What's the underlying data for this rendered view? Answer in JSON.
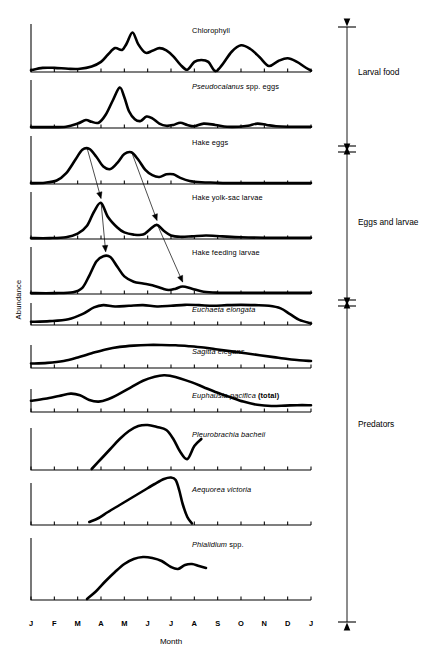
{
  "figure": {
    "y_axis_label": "Abundance",
    "x_axis_label": "Month"
  },
  "months": [
    "J",
    "F",
    "M",
    "A",
    "M",
    "J",
    "J",
    "A",
    "S",
    "O",
    "N",
    "D",
    "J"
  ],
  "groups": [
    {
      "label": "Larval food",
      "panels": [
        "Chlorophyll",
        "Pseudocalanus spp. eggs"
      ]
    },
    {
      "label": "Eggs and larvae",
      "panels": [
        "Hake eggs",
        "Hake yolk-sac larvae",
        "Hake feeding larvae"
      ]
    },
    {
      "label": "Predators",
      "panels": [
        "Euchaeta elongata",
        "Sagitta elegans",
        "Euphausia pacifica (total)",
        "Pleurobrachia bacheii",
        "Aequorea victoria",
        "Phialidium spp."
      ]
    }
  ],
  "panels": [
    {
      "id": "chlorophyll",
      "label_html": "Chlorophyll",
      "label_text": "Chlorophyll",
      "italic": false,
      "group": "Larval food"
    },
    {
      "id": "pseudocalanus",
      "label_html": "<i>Pseudocalanus</i> spp. eggs",
      "label_text": "Pseudocalanus spp. eggs",
      "italic": true,
      "group": "Larval food"
    },
    {
      "id": "hake-eggs",
      "label_html": "Hake eggs",
      "label_text": "Hake eggs",
      "italic": false,
      "group": "Eggs and larvae"
    },
    {
      "id": "hake-yolk-sac-larvae",
      "label_html": "Hake yolk-sac larvae",
      "label_text": "Hake yolk-sac larvae",
      "italic": false,
      "group": "Eggs and larvae"
    },
    {
      "id": "hake-feeding-larvae",
      "label_html": "Hake feeding larvae",
      "label_text": "Hake feeding larvae",
      "italic": false,
      "group": "Eggs and larvae"
    },
    {
      "id": "euchaeta-elongata",
      "label_html": "<i>Euchaeta elongata</i>",
      "label_text": "Euchaeta elongata",
      "italic": true,
      "group": "Predators"
    },
    {
      "id": "sagitta-elegans",
      "label_html": "<i>Sagitta elegans</i>",
      "label_text": "Sagitta elegans",
      "italic": true,
      "group": "Predators"
    },
    {
      "id": "euphausia-pacifica",
      "label_html": "<i>Euphausia pacifica</i> <b>(total)</b>",
      "label_text": "Euphausia pacifica (total)",
      "italic": true,
      "group": "Predators"
    },
    {
      "id": "pleurobrachia-bacheii",
      "label_html": "<i>Pleurobrachia bacheii</i>",
      "label_text": "Pleurobrachia bacheii",
      "italic": true,
      "group": "Predators"
    },
    {
      "id": "aequorea-victoria",
      "label_html": "<i>Aequorea victoria</i>",
      "label_text": "Aequorea victoria",
      "italic": true,
      "group": "Predators"
    },
    {
      "id": "phialidium-spp",
      "label_html": "<i>Phialidium</i> spp.",
      "label_text": "Phialidium spp.",
      "italic": true,
      "group": "Predators"
    }
  ],
  "chart_data": {
    "type": "line",
    "title": "",
    "xlabel": "Month",
    "ylabel": "Abundance",
    "xlim": [
      0,
      12
    ],
    "ylim": [
      0,
      1
    ],
    "grid": false,
    "legend": "none",
    "note": "Eleven stacked time-series panels sharing a Jan-to-Jan month axis. x values are months from January (0) to the following January (12); y values are relative abundance 0-1 (unlabeled axis). Arrows link hake egg peaks to yolk-sac larvae peaks to feeding larvae peaks.",
    "series": [
      {
        "name": "Chlorophyll",
        "x": [
          0.0,
          0.5,
          1.0,
          1.6,
          2.1,
          2.6,
          3.0,
          3.3,
          3.6,
          3.9,
          4.1,
          4.35,
          4.6,
          4.9,
          5.2,
          5.5,
          5.8,
          6.1,
          6.4,
          6.7,
          7.0,
          7.3,
          7.6,
          7.9,
          8.2,
          8.6,
          9.0,
          9.4,
          9.8,
          10.2,
          10.6,
          11.0,
          11.4,
          11.7,
          12.0
        ],
        "y": [
          0.04,
          0.09,
          0.09,
          0.07,
          0.07,
          0.12,
          0.22,
          0.38,
          0.52,
          0.48,
          0.62,
          0.86,
          0.6,
          0.42,
          0.46,
          0.52,
          0.47,
          0.34,
          0.16,
          0.05,
          0.22,
          0.26,
          0.22,
          0.02,
          0.16,
          0.44,
          0.58,
          0.5,
          0.32,
          0.13,
          0.24,
          0.3,
          0.22,
          0.12,
          0.03
        ]
      },
      {
        "name": "Pseudocalanus spp. eggs",
        "x": [
          0.0,
          0.8,
          1.5,
          2.0,
          2.35,
          2.6,
          2.9,
          3.2,
          3.5,
          3.8,
          4.0,
          4.2,
          4.45,
          4.7,
          4.95,
          5.2,
          5.5,
          5.8,
          6.1,
          6.4,
          6.7,
          7.0,
          7.4,
          7.9,
          8.4,
          8.9,
          9.3,
          9.7,
          10.1,
          10.5,
          11.0,
          12.0
        ],
        "y": [
          0.02,
          0.02,
          0.03,
          0.1,
          0.18,
          0.14,
          0.12,
          0.3,
          0.62,
          0.92,
          0.7,
          0.38,
          0.2,
          0.16,
          0.26,
          0.22,
          0.1,
          0.05,
          0.07,
          0.12,
          0.07,
          0.04,
          0.1,
          0.07,
          0.03,
          0.03,
          0.05,
          0.1,
          0.07,
          0.04,
          0.03,
          0.03
        ]
      },
      {
        "name": "Hake eggs",
        "x": [
          0.0,
          0.6,
          1.1,
          1.5,
          1.9,
          2.2,
          2.5,
          2.8,
          3.1,
          3.4,
          3.7,
          4.0,
          4.3,
          4.6,
          4.9,
          5.2,
          5.5,
          5.8,
          6.1,
          6.4,
          6.8,
          7.3,
          7.9,
          8.6,
          12.0
        ],
        "y": [
          0.02,
          0.03,
          0.08,
          0.24,
          0.55,
          0.78,
          0.8,
          0.62,
          0.4,
          0.34,
          0.48,
          0.68,
          0.72,
          0.55,
          0.32,
          0.2,
          0.16,
          0.22,
          0.22,
          0.14,
          0.07,
          0.04,
          0.03,
          0.02,
          0.02
        ]
      },
      {
        "name": "Hake yolk-sac larvae",
        "x": [
          0.0,
          0.8,
          1.5,
          2.0,
          2.4,
          2.7,
          3.0,
          3.3,
          3.7,
          4.0,
          4.4,
          4.8,
          5.1,
          5.4,
          5.7,
          6.0,
          6.4,
          6.9,
          7.5,
          8.2,
          9.0,
          10.0,
          11.0,
          12.0
        ],
        "y": [
          0.02,
          0.02,
          0.04,
          0.12,
          0.3,
          0.62,
          0.82,
          0.5,
          0.26,
          0.15,
          0.1,
          0.1,
          0.22,
          0.32,
          0.18,
          0.08,
          0.05,
          0.06,
          0.08,
          0.06,
          0.04,
          0.03,
          0.03,
          0.03
        ]
      },
      {
        "name": "Hake feeding larvae",
        "x": [
          0.0,
          1.0,
          1.8,
          2.2,
          2.5,
          2.8,
          3.1,
          3.4,
          3.7,
          4.0,
          4.4,
          4.8,
          5.2,
          5.6,
          5.9,
          6.2,
          6.5,
          6.9,
          7.4,
          8.0,
          9.0,
          10.0,
          11.0,
          12.0
        ],
        "y": [
          0.02,
          0.02,
          0.04,
          0.14,
          0.42,
          0.74,
          0.86,
          0.84,
          0.62,
          0.4,
          0.28,
          0.24,
          0.2,
          0.13,
          0.09,
          0.12,
          0.17,
          0.12,
          0.05,
          0.03,
          0.03,
          0.03,
          0.03,
          0.03
        ]
      },
      {
        "name": "Euchaeta elongata",
        "x": [
          0.0,
          0.8,
          1.6,
          2.2,
          2.7,
          3.1,
          3.6,
          4.2,
          4.8,
          5.4,
          6.0,
          6.6,
          7.2,
          7.8,
          8.4,
          9.0,
          9.6,
          10.2,
          10.7,
          11.1,
          11.5,
          12.0
        ],
        "y": [
          0.1,
          0.12,
          0.18,
          0.34,
          0.55,
          0.62,
          0.58,
          0.6,
          0.62,
          0.58,
          0.6,
          0.63,
          0.62,
          0.6,
          0.62,
          0.63,
          0.62,
          0.6,
          0.52,
          0.34,
          0.16,
          0.05
        ]
      },
      {
        "name": "Sagitta elegans",
        "x": [
          0.0,
          0.7,
          1.4,
          2.0,
          2.6,
          3.2,
          3.8,
          4.4,
          5.0,
          5.6,
          6.2,
          6.8,
          7.4,
          8.0,
          8.6,
          9.2,
          9.8,
          10.4,
          11.0,
          11.5,
          12.0
        ],
        "y": [
          0.14,
          0.16,
          0.22,
          0.33,
          0.46,
          0.58,
          0.66,
          0.7,
          0.72,
          0.72,
          0.71,
          0.68,
          0.64,
          0.58,
          0.52,
          0.46,
          0.4,
          0.34,
          0.28,
          0.24,
          0.22
        ]
      },
      {
        "name": "Euphausia pacifica (total)",
        "x": [
          0.0,
          0.6,
          1.2,
          1.7,
          2.1,
          2.5,
          2.9,
          3.3,
          3.8,
          4.3,
          4.8,
          5.3,
          5.7,
          6.0,
          6.4,
          6.9,
          7.4,
          7.9,
          8.5,
          9.1,
          9.7,
          10.3,
          10.9,
          11.4,
          12.0
        ],
        "y": [
          0.28,
          0.33,
          0.4,
          0.46,
          0.42,
          0.3,
          0.26,
          0.32,
          0.46,
          0.62,
          0.78,
          0.88,
          0.92,
          0.9,
          0.84,
          0.74,
          0.62,
          0.5,
          0.38,
          0.26,
          0.18,
          0.15,
          0.16,
          0.17,
          0.17
        ]
      },
      {
        "name": "Pleurobrachia bacheii",
        "x": [
          2.6,
          3.0,
          3.4,
          3.8,
          4.2,
          4.6,
          5.0,
          5.4,
          5.8,
          6.1,
          6.4,
          6.7,
          7.0,
          7.3
        ],
        "y": [
          0.02,
          0.22,
          0.42,
          0.62,
          0.78,
          0.88,
          0.9,
          0.86,
          0.8,
          0.62,
          0.36,
          0.22,
          0.48,
          0.62
        ]
      },
      {
        "name": "Aequorea victoria",
        "x": [
          2.5,
          2.9,
          3.3,
          3.8,
          4.3,
          4.8,
          5.3,
          5.7,
          6.0,
          6.2,
          6.35,
          6.5,
          6.7,
          6.9
        ],
        "y": [
          0.06,
          0.14,
          0.26,
          0.4,
          0.54,
          0.68,
          0.82,
          0.92,
          0.95,
          0.9,
          0.7,
          0.42,
          0.16,
          0.03
        ]
      },
      {
        "name": "Phialidium spp.",
        "x": [
          2.4,
          2.8,
          3.2,
          3.6,
          4.0,
          4.4,
          4.8,
          5.2,
          5.6,
          6.0,
          6.3,
          6.6,
          6.9,
          7.2,
          7.5
        ],
        "y": [
          0.02,
          0.18,
          0.38,
          0.56,
          0.72,
          0.82,
          0.86,
          0.84,
          0.78,
          0.66,
          0.62,
          0.7,
          0.72,
          0.68,
          0.64
        ]
      }
    ],
    "annotations": [
      {
        "type": "arrow",
        "label": "hake egg peak 1 to yolk-sac larvae peak 1",
        "from_panel": "Hake eggs",
        "from_x": 2.4,
        "to_panel": "Hake yolk-sac larvae",
        "to_x": 3.0
      },
      {
        "type": "arrow",
        "label": "hake egg peak 2 to yolk-sac larvae peak 2",
        "from_panel": "Hake eggs",
        "from_x": 4.3,
        "to_panel": "Hake yolk-sac larvae",
        "to_x": 5.4
      },
      {
        "type": "arrow",
        "label": "yolk-sac larvae peak 1 to feeding larvae peak 1",
        "from_panel": "Hake yolk-sac larvae",
        "from_x": 3.0,
        "to_panel": "Hake feeding larvae",
        "to_x": 3.2
      },
      {
        "type": "arrow",
        "label": "yolk-sac larvae peak 2 to feeding larvae peak 2",
        "from_panel": "Hake yolk-sac larvae",
        "from_x": 5.4,
        "to_panel": "Hake feeding larvae",
        "to_x": 6.5
      }
    ]
  }
}
